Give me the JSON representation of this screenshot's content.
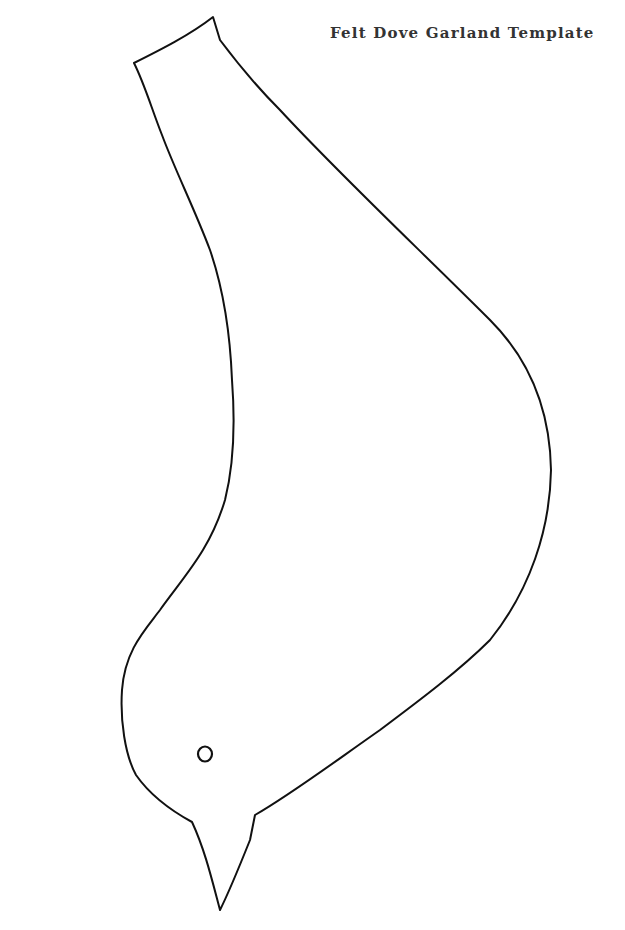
{
  "document": {
    "title": "Felt Dove Garland Template"
  },
  "template": {
    "shape": "dove",
    "outline_color": "#111111",
    "eye_marker": "hole"
  }
}
